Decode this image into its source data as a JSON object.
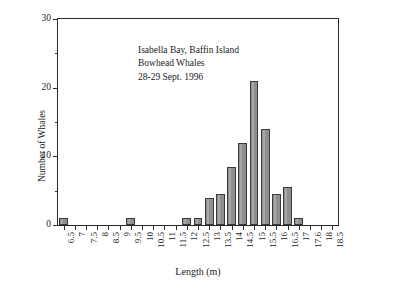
{
  "chart_data": {
    "type": "bar",
    "title": "",
    "xlabel": "Length (m)",
    "ylabel": "Number of Whales",
    "xlim": [
      6.25,
      18.75
    ],
    "ylim": [
      0,
      30
    ],
    "grid": false,
    "legend": null,
    "annotations": [
      "Isabella Bay, Baffin Island",
      "Bowhead Whales",
      "28-29 Sept. 1996"
    ],
    "categories": [
      "6.5",
      "7",
      "7.5",
      "8",
      "8.5",
      "9",
      "9.5",
      "10",
      "10.5",
      "11",
      "11.5",
      "12",
      "12.5",
      "13",
      "13.5",
      "14",
      "14.5",
      "15",
      "15.5",
      "16",
      "16.5",
      "17",
      "17.6",
      "18",
      "18.5"
    ],
    "values": [
      1,
      0,
      0,
      0,
      0,
      0,
      1,
      0,
      0,
      0,
      0,
      1,
      1,
      4,
      4.5,
      8.5,
      12,
      21,
      14,
      4.5,
      5.5,
      1,
      0,
      0,
      0
    ],
    "x_tick_labels": [
      "6.5",
      "7",
      "7.5",
      "8",
      "8.5",
      "9",
      "9.5",
      "10",
      "10.5",
      "11",
      "11.5",
      "12",
      "12.5",
      "13",
      "13.5",
      "14",
      "14.5",
      "15",
      "15.5",
      "16",
      "16.5",
      "17",
      "17.6",
      "18",
      "18.5"
    ],
    "y_tick_labels": [
      "0",
      "10",
      "20",
      "30"
    ],
    "y_ticks_major": [
      0,
      10,
      20,
      30
    ],
    "y_ticks_minor": [
      5,
      15,
      25
    ],
    "bar_color": "#8f8f8f",
    "bar_edge_color": "#3a3a3a",
    "axis_color": "#2b2b2b"
  }
}
